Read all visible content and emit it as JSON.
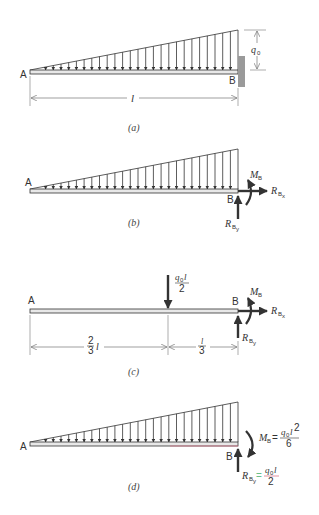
{
  "figure": {
    "panels": [
      {
        "id": "a",
        "caption": "(a)",
        "point_left": "A",
        "point_right": "B",
        "load": "linearly varying distributed load, zero at A to q0 at B",
        "load_intensity_label": "q",
        "load_intensity_sub": "0",
        "span_label": "l",
        "support": "fixed wall at B"
      },
      {
        "id": "b",
        "caption": "(b)",
        "point_left": "A",
        "point_right": "B",
        "moment_label": "M",
        "moment_sub": "B",
        "rx_label": "R",
        "rx_sub": "B",
        "rx_subsub": "x",
        "ry_label": "R",
        "ry_sub": "B",
        "ry_subsub": "y"
      },
      {
        "id": "c",
        "caption": "(c)",
        "point_left": "A",
        "point_right": "B",
        "resultant_num": "q",
        "resultant_num_sub": "0",
        "resultant_num_tail": "l",
        "resultant_den": "2",
        "dim_left_num": "2",
        "dim_left_den": "3",
        "dim_left_tail": "l",
        "dim_right_num": "l",
        "dim_right_den": "3",
        "moment_label": "M",
        "moment_sub": "B",
        "rx_label": "R",
        "rx_sub": "B",
        "rx_subsub": "x",
        "ry_label": "R",
        "ry_sub": "B",
        "ry_subsub": "y"
      },
      {
        "id": "d",
        "caption": "(d)",
        "point_left": "A",
        "point_right": "B",
        "moment_label": "M",
        "moment_sub": "B",
        "moment_eq": "=",
        "moment_num": "q",
        "moment_num_sub": "0",
        "moment_num_tail": "l",
        "moment_num_exp": "2",
        "moment_den": "6",
        "ry_label": "R",
        "ry_sub": "B",
        "ry_subsub": "y",
        "ry_eq": "=",
        "ry_num": "q",
        "ry_num_sub": "0",
        "ry_num_tail": "l",
        "ry_den": "2"
      }
    ],
    "colors": {
      "ink": "#333333",
      "beam_fill": "#e8e8e8",
      "wall": "#9a9a9a",
      "highlight_red": "#d9778a",
      "highlight_green": "#6cbf8a"
    }
  }
}
